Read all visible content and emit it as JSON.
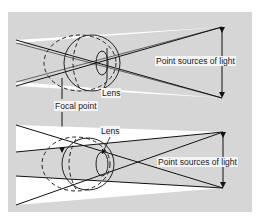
{
  "diagram": {
    "top": {
      "label_lens": "Lens",
      "label_sources": "Point sources of light"
    },
    "shared": {
      "label_focal": "Focal point"
    },
    "bottom": {
      "label_lens": "Lens",
      "label_sources": "Point sources of light"
    }
  }
}
